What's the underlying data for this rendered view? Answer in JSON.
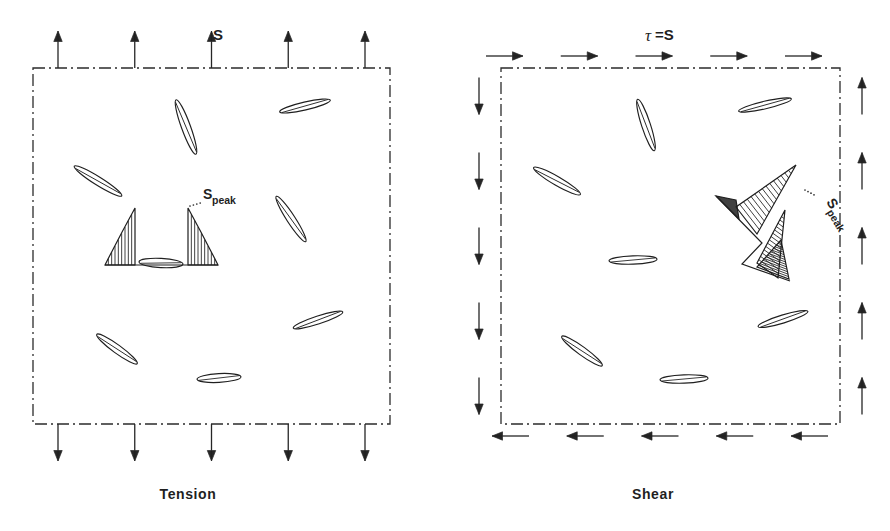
{
  "figure": {
    "type": "diagram",
    "background_color": "#ffffff",
    "ink_color": "#1f1f1f"
  },
  "panels": [
    {
      "id": "tension",
      "caption": "Tension",
      "caption_x": 188,
      "caption_y": 499,
      "load_label": "S",
      "load_label_x": 218,
      "load_label_y": 40,
      "peak_label_main": "S",
      "peak_label_sub": "peak",
      "peak_label_x": 203,
      "peak_label_y": 199,
      "peak_label_rotation": 0,
      "body": {
        "x": 33,
        "y": 68,
        "width": 357,
        "height": 356
      },
      "arrow_count_top": 5,
      "arrow_count_bottom": 5,
      "arrow_direction_top": "up",
      "arrow_direction_bottom": "down",
      "arrow_length": 37,
      "flaws": [
        {
          "cx": 305,
          "cy": 106,
          "rx": 26,
          "ry": 4.0,
          "angle": -13
        },
        {
          "cx": 186,
          "cy": 127,
          "rx": 29,
          "ry": 4.5,
          "angle": 70
        },
        {
          "cx": 98,
          "cy": 181,
          "rx": 28,
          "ry": 4.2,
          "angle": 32
        },
        {
          "cx": 291,
          "cy": 219,
          "rx": 27,
          "ry": 4.2,
          "angle": 57
        },
        {
          "cx": 161,
          "cy": 263,
          "rx": 22,
          "ry": 4.6,
          "angle": 3
        },
        {
          "cx": 318,
          "cy": 320,
          "rx": 26,
          "ry": 4.0,
          "angle": -18
        },
        {
          "cx": 117,
          "cy": 349,
          "rx": 25,
          "ry": 4.2,
          "angle": 36
        },
        {
          "cx": 219,
          "cy": 378,
          "rx": 22,
          "ry": 4.4,
          "angle": -3
        }
      ],
      "stress_lobe": {
        "kind": "symmetric-twin-peak",
        "center_x": 161,
        "base_y": 265,
        "peak_left_x": 135,
        "peak_right_x": 188,
        "peak_height": 57,
        "half_width": 30,
        "hatch_spacing": 3.6
      }
    },
    {
      "id": "shear",
      "caption": "Shear",
      "caption_x": 653,
      "caption_y": 499,
      "load_label_tau": "τ",
      "load_label_eq": "=S",
      "load_label_x": 651,
      "load_label_y": 40,
      "peak_label_main": "S",
      "peak_label_sub": "peak",
      "peak_label_x": 826,
      "peak_label_y": 202,
      "peak_label_rotation": 58,
      "body": {
        "x": 501,
        "y": 68,
        "width": 339,
        "height": 356
      },
      "arrow_count_top": 5,
      "arrow_count_bottom": 5,
      "arrow_count_left": 5,
      "arrow_count_right": 5,
      "arrow_direction_top": "right",
      "arrow_direction_bottom": "left",
      "arrow_direction_left": "down",
      "arrow_direction_right": "up",
      "arrow_length": 37,
      "flaws": [
        {
          "cx": 765,
          "cy": 105,
          "rx": 27,
          "ry": 3.8,
          "angle": -13
        },
        {
          "cx": 646,
          "cy": 125,
          "rx": 27,
          "ry": 4.4,
          "angle": 72
        },
        {
          "cx": 557,
          "cy": 181,
          "rx": 27,
          "ry": 4.4,
          "angle": 30
        },
        {
          "cx": 633,
          "cy": 260,
          "rx": 24,
          "ry": 4.2,
          "angle": -2
        },
        {
          "cx": 783,
          "cy": 319,
          "rx": 26,
          "ry": 4.0,
          "angle": -17
        },
        {
          "cx": 582,
          "cy": 351,
          "rx": 25,
          "ry": 4.2,
          "angle": 36
        },
        {
          "cx": 684,
          "cy": 379,
          "rx": 24,
          "ry": 4.2,
          "angle": -2
        }
      ],
      "stress_lobe": {
        "kind": "diagonal-twin-lobe",
        "upper_tip_x": 796,
        "upper_tip_y": 165,
        "lower_tip_x": 764,
        "lower_tip_y": 249,
        "hatch_spacing": 4.2
      }
    }
  ],
  "icons": {
    "arrow_up": "arrow-up-icon",
    "arrow_down": "arrow-down-icon",
    "arrow_left": "arrow-left-icon",
    "arrow_right": "arrow-right-icon"
  }
}
